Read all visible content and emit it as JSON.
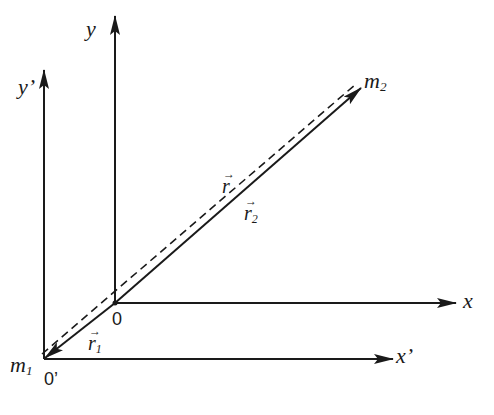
{
  "diagram": {
    "colors": {
      "ink": "#1a1a1a",
      "background": "#ffffff"
    },
    "frames": [
      {
        "name": "unprimed",
        "origin_label": "0",
        "origin_px": [
          115,
          303
        ],
        "x_axis_label": "x",
        "y_axis_label": "y",
        "x_axis_end_px": [
          455,
          303
        ],
        "y_axis_end_px": [
          115,
          15
        ]
      },
      {
        "name": "primed",
        "origin_label": "0’",
        "origin_px": [
          44,
          359
        ],
        "x_axis_label": "x’",
        "y_axis_label": "y’",
        "x_axis_end_px": [
          393,
          359
        ],
        "y_axis_end_px": [
          44,
          70
        ]
      }
    ],
    "masses": [
      {
        "label": "m",
        "subscript": "1",
        "position_px": [
          44,
          359
        ]
      },
      {
        "label": "m",
        "subscript": "2",
        "position_px": [
          360,
          88
        ]
      }
    ],
    "vectors": [
      {
        "symbol": "r",
        "subscript": "",
        "style": "dashed",
        "from": "m1",
        "to": "m2",
        "description": "relative position vector r"
      },
      {
        "symbol": "r",
        "subscript": "2",
        "style": "solid",
        "from": "0",
        "to": "m2",
        "description": "position of m2 in unprimed frame"
      },
      {
        "symbol": "r",
        "subscript": "1",
        "style": "solid",
        "from": "0",
        "to": "m1",
        "description": "position of m1 in unprimed frame"
      }
    ],
    "labels": {
      "y": "y",
      "y_prime": "y’",
      "x": "x",
      "x_prime": "x’",
      "origin": "0",
      "origin_prime": "0’",
      "m1_base": "m",
      "m1_sub": "1",
      "m2_base": "m",
      "m2_sub": "2",
      "r": "r",
      "r2_base": "r",
      "r2_sub": "2",
      "r1_base": "r",
      "r1_sub": "1",
      "vec_arrow": "→"
    }
  }
}
